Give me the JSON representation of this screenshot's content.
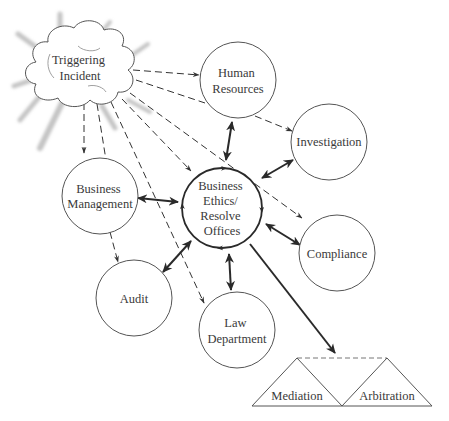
{
  "diagram": {
    "type": "process-flow",
    "source": {
      "id": "triggering-incident",
      "shape": "cloud",
      "label_lines": [
        "Triggering",
        "Incident"
      ]
    },
    "center": {
      "id": "business-ethics-resolve-offices",
      "label_lines": [
        "Business",
        "Ethics/",
        "Resolve",
        "Offices"
      ]
    },
    "nodes": [
      {
        "id": "human-resources",
        "label_lines": [
          "Human",
          "Resources"
        ]
      },
      {
        "id": "investigation",
        "label_lines": [
          "Investigation"
        ]
      },
      {
        "id": "business-management",
        "label_lines": [
          "Business",
          "Management"
        ]
      },
      {
        "id": "compliance",
        "label_lines": [
          "Compliance"
        ]
      },
      {
        "id": "audit",
        "label_lines": [
          "Audit"
        ]
      },
      {
        "id": "law-department",
        "label_lines": [
          "Law",
          "Department"
        ]
      }
    ],
    "outcomes": [
      {
        "id": "mediation",
        "label": "Mediation",
        "shape": "triangle"
      },
      {
        "id": "arbitration",
        "label": "Arbitration",
        "shape": "triangle"
      }
    ],
    "edges": {
      "dashed_from_incident_to": [
        "human-resources",
        "investigation",
        "business-management",
        "business-ethics-resolve-offices",
        "compliance",
        "audit",
        "law-department"
      ],
      "bidirectional_with_center": [
        "human-resources",
        "investigation",
        "business-management",
        "compliance",
        "audit",
        "law-department"
      ],
      "center_to_outcomes": "solid arrow to dashed line joining mediation and arbitration"
    },
    "colors": {
      "stroke": "#555555",
      "arrow": "#2a2a2a",
      "text": "#3a3a3a",
      "cloud_glow": "#c8c8c8"
    }
  }
}
